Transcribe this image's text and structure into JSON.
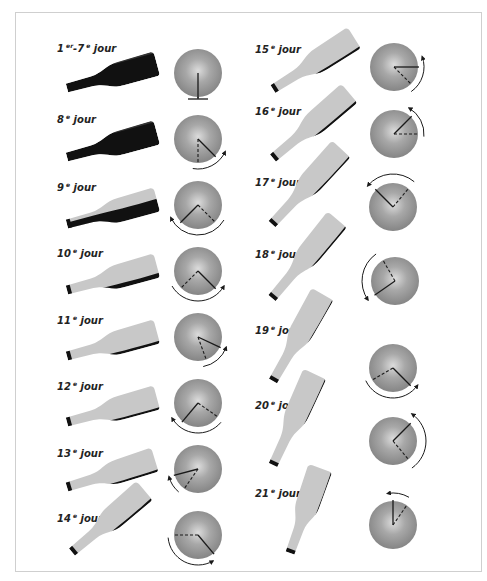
{
  "colors": {
    "bottle_light": "#c8c8c8",
    "bottle_dark": "#111111",
    "disc_outer": "#8c8c8c",
    "disc_inner": "#d6d6d6",
    "line": "#1a1a1a",
    "frame": "#cfcfcf"
  },
  "legend": {
    "solid_line": "position actuelle",
    "dashed_line": "position précédente",
    "arrow": "sens de rotation"
  },
  "steps": [
    {
      "num": "1",
      "sup": "er",
      "num2": "7",
      "sup2": "e",
      "word": "jour",
      "lx": 57,
      "ly": 52,
      "bottle": {
        "nx": 67,
        "ny": 88,
        "ang": -15,
        "len": 93,
        "sediment": 1.0
      },
      "disc": {
        "cx": 198,
        "cy": 73,
        "solid": 90,
        "dashed": null,
        "base": true,
        "arc": null
      }
    },
    {
      "num": "8",
      "sup": "e",
      "word": "jour",
      "lx": 57,
      "ly": 123,
      "bottle": {
        "nx": 67,
        "ny": 157,
        "ang": -15,
        "len": 93,
        "sediment": 1.0
      },
      "disc": {
        "cx": 198,
        "cy": 139,
        "solid": 45,
        "dashed": 90,
        "arc": {
          "r": 30,
          "from": 100,
          "to": 25,
          "dir": "ccw"
        }
      }
    },
    {
      "num": "9",
      "sup": "e",
      "word": "jour",
      "lx": 57,
      "ly": 191,
      "bottle": {
        "nx": 67,
        "ny": 224,
        "ang": -15,
        "len": 93,
        "sediment": 0.55
      },
      "disc": {
        "cx": 198,
        "cy": 205,
        "solid": 135,
        "dashed": 45,
        "arc": {
          "r": 30,
          "from": 30,
          "to": 155,
          "dir": "cw"
        }
      }
    },
    {
      "num": "10",
      "sup": "e",
      "word": "jour",
      "lx": 57,
      "ly": 257,
      "bottle": {
        "nx": 67,
        "ny": 290,
        "ang": -15,
        "len": 93,
        "sediment": 0.2
      },
      "disc": {
        "cx": 198,
        "cy": 271,
        "solid": 45,
        "dashed": 135,
        "arc": {
          "r": 30,
          "from": 150,
          "to": 30,
          "dir": "ccw"
        }
      }
    },
    {
      "num": "11",
      "sup": "e",
      "word": "jour",
      "lx": 57,
      "ly": 324,
      "bottle": {
        "nx": 67,
        "ny": 356,
        "ang": -15,
        "len": 93,
        "sediment": 0.12
      },
      "disc": {
        "cx": 198,
        "cy": 337,
        "solid": 25,
        "dashed": 70,
        "arc": {
          "r": 30,
          "from": 80,
          "to": 20,
          "dir": "ccw"
        }
      }
    },
    {
      "num": "12",
      "sup": "e",
      "word": "jour",
      "lx": 57,
      "ly": 390,
      "bottle": {
        "nx": 67,
        "ny": 422,
        "ang": -15,
        "len": 93,
        "sediment": 0.1
      },
      "disc": {
        "cx": 198,
        "cy": 403,
        "solid": 130,
        "dashed": 35,
        "arc": {
          "r": 30,
          "from": 40,
          "to": 150,
          "dir": "cw"
        }
      }
    },
    {
      "num": "13",
      "sup": "e",
      "word": "jour",
      "lx": 57,
      "ly": 457,
      "bottle": {
        "nx": 67,
        "ny": 487,
        "ang": -17,
        "len": 92,
        "sediment": 0.1
      },
      "disc": {
        "cx": 198,
        "cy": 469,
        "solid": 165,
        "dashed": 125,
        "arc": {
          "r": 30,
          "from": 130,
          "to": 165,
          "dir": "cw"
        }
      }
    },
    {
      "num": "14",
      "sup": "e",
      "word": "jour",
      "lx": 57,
      "ly": 522,
      "bottle": {
        "nx": 72,
        "ny": 552,
        "ang": -40,
        "len": 95,
        "sediment": 0.1
      },
      "disc": {
        "cx": 198,
        "cy": 535,
        "solid": 50,
        "dashed": 180,
        "arc": {
          "r": 30,
          "from": 175,
          "to": 60,
          "dir": "ccw"
        }
      }
    },
    {
      "num": "15",
      "sup": "e",
      "word": "jour",
      "lx": 255,
      "ly": 53,
      "bottle": {
        "nx": 273,
        "ny": 89,
        "ang": -32,
        "len": 96,
        "sediment": 0.1
      },
      "disc": {
        "cx": 394,
        "cy": 67,
        "solid": 0,
        "dashed": 45,
        "arc": {
          "r": 30,
          "from": 55,
          "to": -20,
          "dir": "ccw"
        }
      }
    },
    {
      "num": "16",
      "sup": "e",
      "word": "jour",
      "lx": 255,
      "ly": 115,
      "bottle": {
        "nx": 273,
        "ny": 158,
        "ang": -40,
        "len": 100,
        "sediment": 0.1
      },
      "disc": {
        "cx": 394,
        "cy": 134,
        "solid": -45,
        "dashed": 0,
        "arc": {
          "r": 30,
          "from": 5,
          "to": -60,
          "dir": "ccw"
        }
      }
    },
    {
      "num": "17",
      "sup": "e",
      "word": "jour",
      "lx": 255,
      "ly": 186,
      "bottle": {
        "nx": 272,
        "ny": 224,
        "ang": -47,
        "len": 102,
        "sediment": 0.08
      },
      "disc": {
        "cx": 393,
        "cy": 207,
        "solid": -135,
        "dashed": -50,
        "arc": {
          "r": 33,
          "from": -50,
          "to": -140,
          "dir": "ccw"
        }
      }
    },
    {
      "num": "18",
      "sup": "e",
      "word": "jour",
      "lx": 255,
      "ly": 258,
      "bottle": {
        "nx": 272,
        "ny": 298,
        "ang": -50,
        "len": 102,
        "sediment": 0.08
      },
      "disc": {
        "cx": 395,
        "cy": 281,
        "solid": 145,
        "dashed": -120,
        "arc": {
          "r": 33,
          "from": -125,
          "to": -215,
          "dir": "ccw"
        }
      }
    },
    {
      "num": "19",
      "sup": "e",
      "word": "jour",
      "lx": 255,
      "ly": 334,
      "bottle": {
        "nx": 273,
        "ny": 381,
        "ang": -60,
        "len": 100,
        "sediment": 0.05
      },
      "disc": {
        "cx": 393,
        "cy": 368,
        "solid": 45,
        "dashed": 150,
        "arc": {
          "r": 30,
          "from": 155,
          "to": 35,
          "dir": "ccw"
        }
      }
    },
    {
      "num": "20",
      "sup": "e",
      "word": "jour",
      "lx": 255,
      "ly": 409,
      "bottle": {
        "nx": 273,
        "ny": 465,
        "ang": -65,
        "len": 100,
        "sediment": 0.05
      },
      "disc": {
        "cx": 393,
        "cy": 441,
        "solid": -45,
        "dashed": 50,
        "arc": {
          "r": 33,
          "from": 55,
          "to": -55,
          "dir": "ccw"
        }
      }
    },
    {
      "num": "21",
      "sup": "e",
      "word": "jour",
      "lx": 255,
      "ly": 497,
      "bottle": {
        "nx": 290,
        "ny": 553,
        "ang": -70,
        "len": 90,
        "sediment": 0.05
      },
      "disc": {
        "cx": 393,
        "cy": 525,
        "solid": -90,
        "dashed": -55,
        "arc": {
          "r": 32,
          "from": -60,
          "to": -100,
          "dir": "ccw"
        }
      }
    }
  ]
}
